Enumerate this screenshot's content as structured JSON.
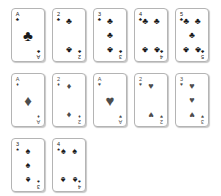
{
  "scene": {
    "title": "Playing card set",
    "background_color": "#ffffff",
    "card_face_color": "#ffffff",
    "card_border_color": "#b4b4b4",
    "pip_color_black": "#1a1a1a",
    "pip_color_red": "#4d4d4d",
    "card_count": 12,
    "rows": 3
  },
  "suit_glyphs": {
    "clubs": "♣",
    "diamonds": "♦",
    "hearts": "♥",
    "spades": "♠"
  },
  "rows": [
    {
      "cards": [
        {
          "rank": "A",
          "suit": "clubs",
          "suit_glyph": "♣",
          "color": "black",
          "name": "ace-of-clubs",
          "pip_count": 1,
          "layout": "ace"
        },
        {
          "rank": "2",
          "suit": "clubs",
          "suit_glyph": "♣",
          "color": "black",
          "name": "two-of-clubs",
          "pip_count": 2,
          "layout": "two"
        },
        {
          "rank": "3",
          "suit": "clubs",
          "suit_glyph": "♣",
          "color": "black",
          "name": "three-of-clubs",
          "pip_count": 3,
          "layout": "three"
        },
        {
          "rank": "4",
          "suit": "clubs",
          "suit_glyph": "♣",
          "color": "black",
          "name": "four-of-clubs",
          "pip_count": 4,
          "layout": "four"
        },
        {
          "rank": "5",
          "suit": "clubs",
          "suit_glyph": "♣",
          "color": "black",
          "name": "five-of-clubs",
          "pip_count": 5,
          "layout": "five"
        }
      ]
    },
    {
      "cards": [
        {
          "rank": "A",
          "suit": "diamonds",
          "suit_glyph": "♦",
          "color": "red",
          "name": "ace-of-diamonds",
          "pip_count": 1,
          "layout": "ace"
        },
        {
          "rank": "2",
          "suit": "diamonds",
          "suit_glyph": "♦",
          "color": "red",
          "name": "two-of-diamonds",
          "pip_count": 2,
          "layout": "two"
        },
        {
          "rank": "A",
          "suit": "hearts",
          "suit_glyph": "♥",
          "color": "red",
          "name": "ace-of-hearts",
          "pip_count": 1,
          "layout": "ace"
        },
        {
          "rank": "2",
          "suit": "hearts",
          "suit_glyph": "♥",
          "color": "red",
          "name": "two-of-hearts",
          "pip_count": 2,
          "layout": "two"
        },
        {
          "rank": "3",
          "suit": "hearts",
          "suit_glyph": "♥",
          "color": "red",
          "name": "three-of-hearts",
          "pip_count": 3,
          "layout": "three"
        }
      ]
    },
    {
      "cards": [
        {
          "rank": "3",
          "suit": "spades",
          "suit_glyph": "♠",
          "color": "black",
          "name": "three-of-spades",
          "pip_count": 3,
          "layout": "three"
        },
        {
          "rank": "4",
          "suit": "spades",
          "suit_glyph": "♠",
          "color": "black",
          "name": "four-of-spades",
          "pip_count": 4,
          "layout": "four"
        }
      ]
    }
  ],
  "pip_layouts": {
    "ace": [
      {
        "x": 50,
        "y": 50,
        "inverted": false,
        "big": true
      }
    ],
    "two": [
      {
        "x": 50,
        "y": 14,
        "inverted": false,
        "big": false
      },
      {
        "x": 50,
        "y": 86,
        "inverted": true,
        "big": false
      }
    ],
    "three": [
      {
        "x": 50,
        "y": 14,
        "inverted": false,
        "big": false
      },
      {
        "x": 50,
        "y": 50,
        "inverted": false,
        "big": false
      },
      {
        "x": 50,
        "y": 86,
        "inverted": true,
        "big": false
      }
    ],
    "four": [
      {
        "x": 24,
        "y": 16,
        "inverted": false,
        "big": false
      },
      {
        "x": 76,
        "y": 16,
        "inverted": false,
        "big": false
      },
      {
        "x": 24,
        "y": 84,
        "inverted": true,
        "big": false
      },
      {
        "x": 76,
        "y": 84,
        "inverted": true,
        "big": false
      }
    ],
    "five": [
      {
        "x": 24,
        "y": 14,
        "inverted": false,
        "big": false
      },
      {
        "x": 76,
        "y": 14,
        "inverted": false,
        "big": false
      },
      {
        "x": 50,
        "y": 50,
        "inverted": false,
        "big": false
      },
      {
        "x": 24,
        "y": 86,
        "inverted": true,
        "big": false
      },
      {
        "x": 76,
        "y": 86,
        "inverted": true,
        "big": false
      }
    ]
  }
}
